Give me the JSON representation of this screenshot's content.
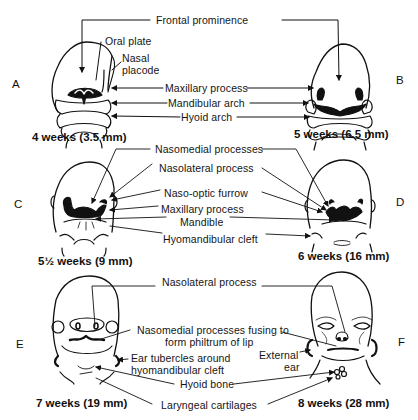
{
  "figure": {
    "panels": [
      {
        "letter": "A",
        "caption": "4 weeks (3.5 mm)"
      },
      {
        "letter": "B",
        "caption": "5 weeks (6.5 mm)"
      },
      {
        "letter": "C",
        "caption": "5½ weeks (9 mm)"
      },
      {
        "letter": "D",
        "caption": "6 weeks (16 mm)"
      },
      {
        "letter": "E",
        "caption": "7 weeks (19 mm)"
      },
      {
        "letter": "F",
        "caption": "8 weeks (28 mm)"
      }
    ],
    "row1_labels": {
      "frontal_prominence": "Frontal prominence",
      "oral_plate": "Oral plate",
      "nasal_placode_1": "Nasal",
      "nasal_placode_2": "placode",
      "maxillary_process": "Maxillary process",
      "mandibular_arch": "Mandibular arch",
      "hyoid_arch": "Hyoid arch"
    },
    "row2_labels": {
      "nasomedial_processes": "Nasomedial processes",
      "nasolateral_process": "Nasolateral process",
      "naso_optic_furrow": "Naso-optic furrow",
      "maxillary_process": "Maxillary process",
      "mandible": "Mandible",
      "hyomandibular_cleft": "Hyomandibular cleft"
    },
    "row3_labels": {
      "nasolateral_process": "Nasolateral process",
      "nasomedial_fusing_1": "Nasomedial processes fusing to",
      "nasomedial_fusing_2": "form philtrum of lip",
      "ear_tubercles_1": "Ear tubercles around",
      "ear_tubercles_2": "hyomandibular cleft",
      "external_ear_1": "External",
      "external_ear_2": "ear",
      "hyoid_bone": "Hyoid bone",
      "laryngeal_cartilages": "Laryngeal cartilages"
    }
  }
}
